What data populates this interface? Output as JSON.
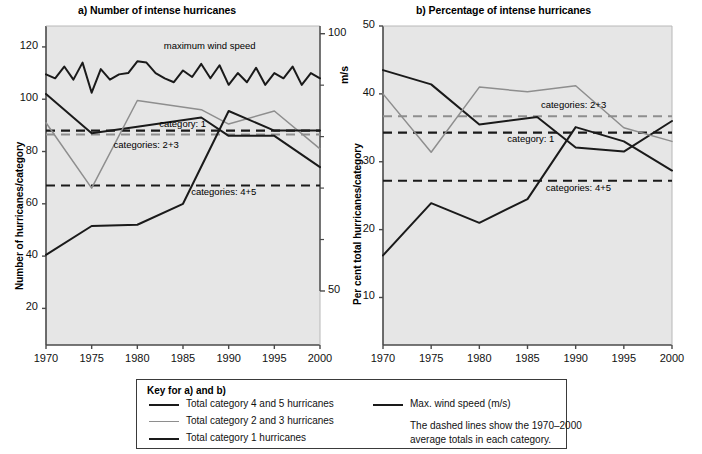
{
  "figure": {
    "panels": [
      {
        "id": "a",
        "title": "a) Number of intense hurricanes",
        "ylabel": "Number of hurricanes/category",
        "y2label": "m/s"
      },
      {
        "id": "b",
        "title": "b) Percentage of intense hurricanes",
        "ylabel": "Per cent total hurricanes/category"
      }
    ]
  },
  "annotations": {
    "wind_speed": "maximum wind speed",
    "category_1": "category: 1",
    "categories_23": "categories: 2+3",
    "categories_45": "categories: 4+5"
  },
  "legend": {
    "title": "Key for a) and b)",
    "entries": [
      {
        "label": "Total category 4 and 5 hurricanes",
        "color": "#1a1a1a",
        "width": 2.0
      },
      {
        "label": "Total category 2 and 3 hurricanes",
        "color": "#8e8e8e",
        "width": 1.4
      },
      {
        "label": "Total category 1 hurricanes",
        "color": "#1a1a1a",
        "width": 2.0
      }
    ],
    "right_entry": {
      "label": "Max. wind speed (m/s)",
      "color": "#1a1a1a",
      "width": 2.0
    },
    "note_line1": "The dashed lines show the 1970–2000",
    "note_line2": "average totals in each category."
  },
  "colors": {
    "plot_background": "#e6e6e6",
    "axis": "#4a4a4a",
    "black_series": "#1a1a1a",
    "gray_series": "#8e8e8e",
    "dashed_black": "#1a1a1a",
    "dashed_gray": "#8e8e8e",
    "page_background": "#ffffff"
  },
  "chart_data": [
    {
      "type": "line",
      "panel": "a",
      "title": "a) Number of intense hurricanes",
      "xlabel": "",
      "ylabel": "Number of hurricanes/category",
      "y2label": "m/s",
      "xlim": [
        1970,
        2000
      ],
      "ylim": [
        6,
        128
      ],
      "y2lim": [
        39.5,
        101.5
      ],
      "xticks": [
        1970,
        1975,
        1980,
        1985,
        1990,
        1995,
        2000
      ],
      "yticks": [
        20,
        40,
        60,
        80,
        100,
        120
      ],
      "y2ticks": [
        50,
        100
      ],
      "y2minorticks": [
        60,
        70,
        80,
        90
      ],
      "grid": false,
      "legend_position": "below-figure",
      "series": [
        {
          "name": "Total category 1 hurricanes",
          "color": "#1a1a1a",
          "style": "solid",
          "x": [
            1970,
            1975,
            1980,
            1987,
            1990,
            1995,
            2000
          ],
          "values": [
            102,
            87,
            89.5,
            93,
            86,
            86,
            74
          ]
        },
        {
          "name": "Total category 2 and 3 hurricanes",
          "color": "#8e8e8e",
          "style": "solid",
          "x": [
            1970,
            1975,
            1980,
            1987,
            1990,
            1995,
            2000
          ],
          "values": [
            91,
            66,
            99.5,
            96,
            90.5,
            95.5,
            81
          ]
        },
        {
          "name": "Total category 4 and 5 hurricanes",
          "color": "#1a1a1a",
          "style": "solid",
          "x": [
            1970,
            1975,
            1980,
            1985,
            1990,
            1995,
            2000
          ],
          "values": [
            40.5,
            51.5,
            52,
            60,
            95.5,
            88,
            88
          ]
        },
        {
          "name": "Max. wind speed (m/s)",
          "color": "#1a1a1a",
          "style": "solid",
          "axis": "right",
          "x": [
            1970,
            1971,
            1972,
            1973,
            1974,
            1975,
            1976,
            1977,
            1978,
            1979,
            1980,
            1981,
            1982,
            1983,
            1984,
            1985,
            1986,
            1987,
            1988,
            1989,
            1990,
            1991,
            1992,
            1993,
            1994,
            1995,
            1996,
            1997,
            1998,
            1999,
            2000
          ],
          "values_left_axis": [
            109.5,
            108,
            112.5,
            107.5,
            114,
            102.5,
            111.5,
            107.5,
            109.5,
            110,
            114.5,
            114,
            110,
            108,
            106.5,
            111,
            108.5,
            113.5,
            108,
            113,
            105.5,
            110,
            106.5,
            112,
            105.5,
            110,
            108,
            112.5,
            105.5,
            110,
            108,
            111.5
          ]
        }
      ],
      "reference_lines": [
        {
          "name": "category: 1 average",
          "value": 88,
          "color": "#1a1a1a",
          "style": "dashed"
        },
        {
          "name": "categories: 2+3 average",
          "value": 86.5,
          "color": "#8e8e8e",
          "style": "dashed"
        },
        {
          "name": "categories: 4+5 average",
          "value": 67,
          "color": "#1a1a1a",
          "style": "dashed"
        }
      ],
      "annotations": [
        {
          "text": "maximum wind speed",
          "x": 1983,
          "y": 120
        },
        {
          "text": "category: 1",
          "x": 1982.5,
          "y": 90
        },
        {
          "text": "categories: 2+3",
          "x": 1977.5,
          "y": 82
        },
        {
          "text": "categories: 4+5",
          "x": 1986,
          "y": 64
        }
      ]
    },
    {
      "type": "line",
      "panel": "b",
      "title": "b) Percentage of intense hurricanes",
      "xlabel": "",
      "ylabel": "Per cent total hurricanes/category",
      "xlim": [
        1970,
        2000
      ],
      "ylim": [
        3,
        50
      ],
      "xticks": [
        1970,
        1975,
        1980,
        1985,
        1990,
        1995,
        2000
      ],
      "yticks": [
        10,
        20,
        30,
        40,
        50
      ],
      "grid": false,
      "legend_position": "below-figure",
      "series": [
        {
          "name": "Total category 1 hurricanes",
          "color": "#1a1a1a",
          "style": "solid",
          "x": [
            1970,
            1975,
            1980,
            1986,
            1990,
            1995,
            2000
          ],
          "values": [
            43.5,
            41.4,
            35.5,
            36.6,
            32.1,
            31.5,
            36.0
          ]
        },
        {
          "name": "Total category 2 and 3 hurricanes",
          "color": "#8e8e8e",
          "style": "solid",
          "x": [
            1970,
            1975,
            1980,
            1985,
            1990,
            1995,
            2000
          ],
          "values": [
            40.0,
            31.4,
            41.0,
            40.3,
            41.2,
            35.0,
            33.0
          ]
        },
        {
          "name": "Total category 4 and 5 hurricanes",
          "color": "#1a1a1a",
          "style": "solid",
          "x": [
            1970,
            1975,
            1980,
            1985,
            1990,
            1995,
            2000
          ],
          "values": [
            16.2,
            23.9,
            21.0,
            24.5,
            35.1,
            33.0,
            28.7
          ]
        }
      ],
      "reference_lines": [
        {
          "name": "categories: 2+3 average",
          "value": 36.7,
          "color": "#8e8e8e",
          "style": "dashed"
        },
        {
          "name": "category: 1 average",
          "value": 34.3,
          "color": "#1a1a1a",
          "style": "dashed"
        },
        {
          "name": "categories: 4+5 average",
          "value": 27.2,
          "color": "#1a1a1a",
          "style": "dashed"
        }
      ],
      "annotations": [
        {
          "text": "categories: 2+3",
          "x": 1986.5,
          "y": 38.2
        },
        {
          "text": "category: 1",
          "x": 1983,
          "y": 33.2
        },
        {
          "text": "categories: 4+5",
          "x": 1987,
          "y": 26.0
        }
      ]
    }
  ]
}
